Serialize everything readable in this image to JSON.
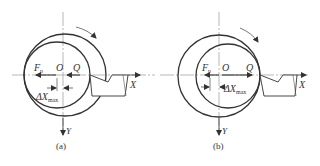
{
  "figure": {
    "type": "engineering diagram: eccentric workpiece turning, radial force and displacement",
    "panels": [
      {
        "id": "a",
        "caption": "(a)",
        "labels": {
          "force": "F",
          "force_sub": "p",
          "center": "O",
          "point": "Q",
          "delta": "ΔX",
          "delta_sub": "max",
          "x_axis": "X",
          "y_axis": "Y"
        }
      },
      {
        "id": "b",
        "caption": "(b)",
        "labels": {
          "force": "F",
          "force_sub": "p",
          "center": "O",
          "point": "Q",
          "delta": "ΔX",
          "delta_sub": "max",
          "x_axis": "X",
          "y_axis": "Y"
        }
      }
    ],
    "colors": {
      "stroke": "#333333",
      "axis": "#888888",
      "background": "#ffffff"
    }
  }
}
